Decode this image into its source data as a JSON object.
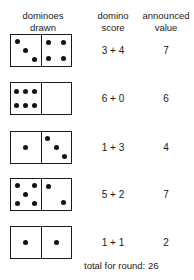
{
  "headers": {
    "drawn": [
      "dominoes",
      "drawn"
    ],
    "score": [
      "domino",
      "score"
    ],
    "value": [
      "announced",
      "value"
    ]
  },
  "rows": [
    {
      "left": 3,
      "right": 4,
      "score": "3 + 4",
      "value": "7"
    },
    {
      "left": 6,
      "right": 0,
      "score": "6 + 0",
      "value": "6"
    },
    {
      "left": 1,
      "right": 3,
      "score": "1 + 3",
      "value": "4"
    },
    {
      "left": 5,
      "right": 2,
      "score": "5 + 2",
      "value": "7"
    },
    {
      "left": 1,
      "right": 1,
      "score": "1 + 1",
      "value": "2"
    }
  ],
  "total": {
    "label": "total for round:",
    "value": "26",
    "text": "total for round: 26"
  }
}
